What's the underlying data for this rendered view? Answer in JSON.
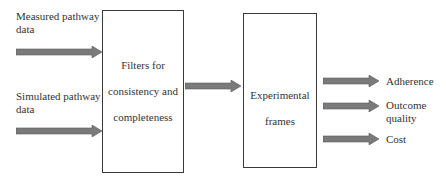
{
  "diagram": {
    "inputs": [
      {
        "label_line1": "Measured pathway",
        "label_line2": "data"
      },
      {
        "label_line1": "Simulated pathway",
        "label_line2": "data"
      }
    ],
    "filter_box": {
      "line1": "Filters for",
      "line2": "consistency and",
      "line3": "completeness"
    },
    "frames_box": {
      "line1": "Experimental",
      "line2": "frames"
    },
    "outputs": [
      {
        "label_line1": "Adherence",
        "label_line2": ""
      },
      {
        "label_line1": "Outcome",
        "label_line2": "quality"
      },
      {
        "label_line1": "Cost",
        "label_line2": ""
      }
    ],
    "colors": {
      "arrow_fill": "#7a7a7a",
      "arrow_stroke": "#5a5a5a",
      "box_border": "#3a3a3a"
    }
  }
}
